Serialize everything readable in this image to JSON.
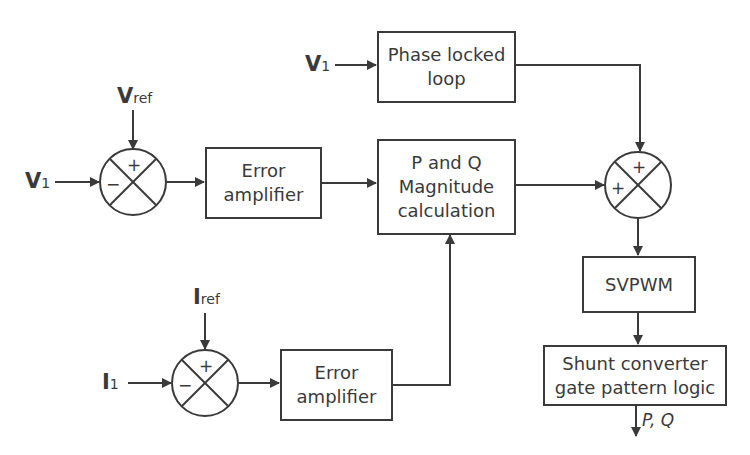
{
  "diagram": {
    "type": "block-diagram",
    "stroke_color": "#3a3a3a",
    "inputs": {
      "v1_top": {
        "main": "V",
        "sub": "1"
      },
      "v1_left": {
        "main": "V",
        "sub": "1"
      },
      "vref": {
        "main": "V",
        "sub": "ref"
      },
      "iref": {
        "main": "I",
        "sub": "ref"
      },
      "i1": {
        "main": "I",
        "sub": "1"
      }
    },
    "blocks": {
      "pll": {
        "line1": "Phase locked",
        "line2": "loop"
      },
      "error_amp_1": {
        "line1": "Error",
        "line2": "amplifier"
      },
      "pq_calc": {
        "line1": "P and Q",
        "line2": "Magnitude",
        "line3": "calculation"
      },
      "error_amp_2": {
        "line1": "Error",
        "line2": "amplifier"
      },
      "svpwm": {
        "line1": "SVPWM"
      },
      "shunt": {
        "line1": "Shunt converter",
        "line2": "gate pattern logic"
      }
    },
    "summing_junctions": {
      "sj1": {
        "top": "+",
        "left": "−"
      },
      "sj2": {
        "top": "+",
        "left": "+"
      },
      "sj3": {
        "top": "+",
        "left": "−"
      }
    },
    "output": {
      "label": "P, Q"
    }
  }
}
